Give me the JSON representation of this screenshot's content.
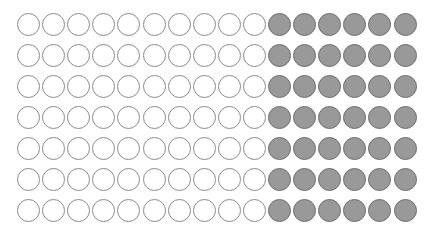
{
  "figure": {
    "type": "dot-array",
    "rows": 7,
    "columns": 16,
    "empty_per_row": 10,
    "filled_per_row": 6,
    "total_dots": 112,
    "total_empty": 70,
    "total_filled": 42,
    "colors": {
      "empty_fill": "#ffffff",
      "empty_stroke": "#8a8a8a",
      "filled_fill": "#999999",
      "filled_stroke": "#6e6e6e"
    },
    "layout": {
      "origin_x": 17,
      "origin_y": 13,
      "col_step": 25.1,
      "row_step": 31,
      "diameter": 23
    }
  }
}
